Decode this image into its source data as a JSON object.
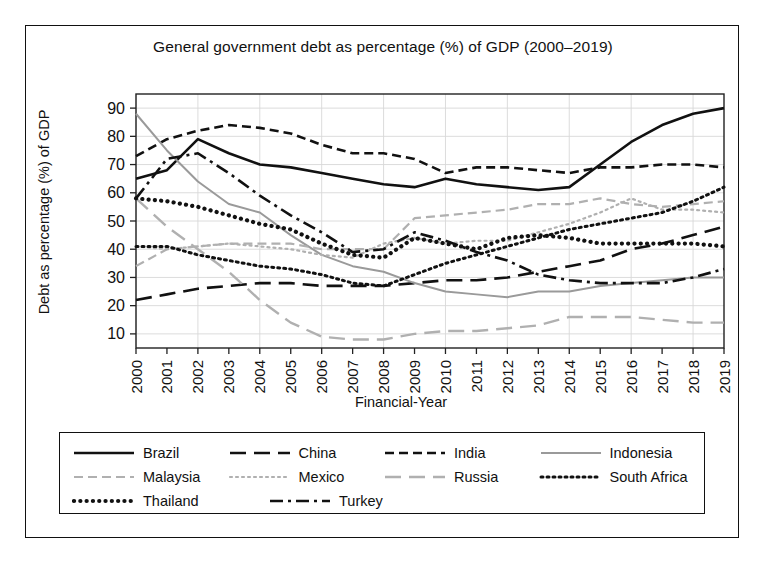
{
  "figure": {
    "title": "General government debt as percentage (%) of GDP (2000–2019)",
    "xlabel": "Financial-Year",
    "ylabel": "Debt as percentage (%) of GDP"
  },
  "chart_data": {
    "type": "line",
    "title": "General government debt as percentage (%) of GDP (2000–2019)",
    "xlabel": "Financial-Year",
    "ylabel": "Debt as percentage (%) of GDP",
    "grid": true,
    "legend_position": "below-plot",
    "xlim": [
      2000,
      2019
    ],
    "ylim": [
      5,
      95
    ],
    "yticks": [
      10,
      20,
      30,
      40,
      50,
      60,
      70,
      80,
      90
    ],
    "categories": [
      "2000",
      "2001",
      "2002",
      "2003",
      "2004",
      "2005",
      "2006",
      "2007",
      "2008",
      "2009",
      "2010",
      "2011",
      "2012",
      "2013",
      "2014",
      "2015",
      "2016",
      "2017",
      "2018",
      "2019"
    ],
    "series": [
      {
        "name": "Brazil",
        "color": "#111111",
        "style": "solid",
        "width": 2.6,
        "values": [
          65,
          68,
          79,
          74,
          70,
          69,
          67,
          65,
          63,
          62,
          65,
          63,
          62,
          61,
          62,
          70,
          78,
          84,
          88,
          90
        ]
      },
      {
        "name": "China",
        "color": "#111111",
        "style": "long-dash",
        "width": 2.6,
        "values": [
          22,
          24,
          26,
          27,
          28,
          28,
          27,
          27,
          27,
          28,
          29,
          29,
          30,
          32,
          34,
          36,
          40,
          42,
          45,
          48
        ]
      },
      {
        "name": "India",
        "color": "#111111",
        "style": "dash",
        "width": 2.6,
        "values": [
          73,
          79,
          82,
          84,
          83,
          81,
          77,
          74,
          74,
          72,
          67,
          69,
          69,
          68,
          67,
          69,
          69,
          70,
          70,
          69
        ]
      },
      {
        "name": "Indonesia",
        "color": "#9a9a9a",
        "style": "solid",
        "width": 2.0,
        "values": [
          88,
          75,
          64,
          56,
          53,
          45,
          38,
          34,
          32,
          28,
          25,
          24,
          23,
          25,
          25,
          27,
          28,
          29,
          30,
          30
        ]
      },
      {
        "name": "Malaysia",
        "color": "#b0b0b0",
        "style": "dash",
        "width": 2.2,
        "values": [
          34,
          40,
          41,
          42,
          42,
          42,
          40,
          40,
          40,
          51,
          52,
          53,
          54,
          56,
          56,
          58,
          56,
          55,
          56,
          57
        ]
      },
      {
        "name": "Mexico",
        "color": "#b0b0b0",
        "style": "dot",
        "width": 2.2,
        "values": [
          41,
          40,
          41,
          42,
          41,
          40,
          38,
          37,
          42,
          44,
          42,
          43,
          43,
          46,
          49,
          53,
          58,
          54,
          54,
          53
        ]
      },
      {
        "name": "Russia",
        "color": "#b0b0b0",
        "style": "long-dash",
        "width": 2.4,
        "values": [
          58,
          48,
          40,
          32,
          22,
          14,
          9,
          8,
          8,
          10,
          11,
          11,
          12,
          13,
          16,
          16,
          16,
          15,
          14,
          14
        ]
      },
      {
        "name": "South Africa",
        "color": "#111111",
        "style": "dot",
        "width": 3.0,
        "values": [
          41,
          41,
          38,
          36,
          34,
          33,
          31,
          28,
          27,
          31,
          35,
          38,
          41,
          44,
          47,
          49,
          51,
          53,
          57,
          62
        ]
      },
      {
        "name": "Thailand",
        "color": "#111111",
        "style": "thick-dot",
        "width": 4.2,
        "values": [
          58,
          57,
          55,
          52,
          49,
          47,
          42,
          38,
          37,
          44,
          42,
          40,
          44,
          45,
          44,
          42,
          42,
          42,
          42,
          41
        ]
      },
      {
        "name": "Turkey",
        "color": "#111111",
        "style": "dash-dot",
        "width": 2.6,
        "values": [
          58,
          72,
          74,
          67,
          59,
          52,
          46,
          39,
          40,
          46,
          43,
          39,
          36,
          31,
          29,
          28,
          28,
          28,
          30,
          33
        ]
      }
    ]
  },
  "legend": {
    "rows": [
      [
        {
          "label": "Brazil",
          "series": 0
        },
        {
          "label": "China",
          "series": 1
        },
        {
          "label": "India",
          "series": 2
        },
        {
          "label": "Indonesia",
          "series": 3
        }
      ],
      [
        {
          "label": "Malaysia",
          "series": 4
        },
        {
          "label": "Mexico",
          "series": 5
        },
        {
          "label": "Russia",
          "series": 6
        },
        {
          "label": "South Africa",
          "series": 7
        }
      ],
      [
        {
          "label": "Thailand",
          "series": 8
        },
        {
          "label": "Turkey",
          "series": 9
        }
      ]
    ]
  }
}
